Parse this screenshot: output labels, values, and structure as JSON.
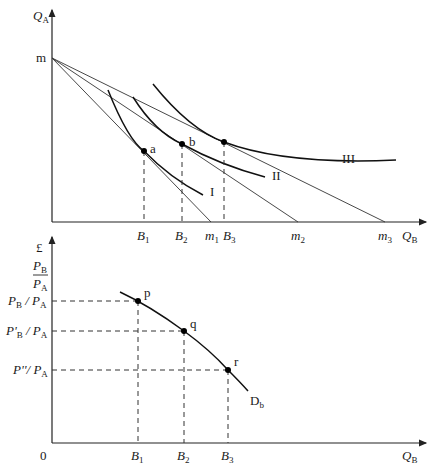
{
  "top_panel": {
    "y_axis_label": "Q",
    "y_axis_sub": "A",
    "x_axis_label": "Q",
    "x_axis_sub": "B",
    "intercept_label": "m",
    "budget_line_intercepts": [
      {
        "label": "m",
        "sub": "1"
      },
      {
        "label": "m",
        "sub": "2"
      },
      {
        "label": "m",
        "sub": "3"
      }
    ],
    "quantity_ticks": [
      {
        "label": "B",
        "sub": "1"
      },
      {
        "label": "B",
        "sub": "2"
      },
      {
        "label": "B",
        "sub": "3"
      }
    ],
    "indifference_curves": [
      "I",
      "II",
      "III"
    ],
    "tangency_points": [
      "a",
      "b",
      ""
    ]
  },
  "bottom_panel": {
    "currency_label": "£",
    "y_axis_fraction": {
      "num": "P",
      "num_sub": "B",
      "den": "P",
      "den_sub": "A"
    },
    "price_levels": [
      {
        "pre": "P",
        "sub": "B",
        "post": " / P",
        "post_sub": "A"
      },
      {
        "pre": "P'",
        "sub": "B",
        "post": " / P",
        "post_sub": "A"
      },
      {
        "pre": "P''",
        "sub": "",
        "post": "/ P",
        "post_sub": "A"
      }
    ],
    "origin_label": "0",
    "x_axis_label": "Q",
    "x_axis_sub": "B",
    "quantity_ticks": [
      {
        "label": "B",
        "sub": "1"
      },
      {
        "label": "B",
        "sub": "2"
      },
      {
        "label": "B",
        "sub": "3"
      }
    ],
    "demand_points": [
      "p",
      "q",
      "r"
    ],
    "demand_curve_label": "D",
    "demand_curve_sub": "b"
  }
}
